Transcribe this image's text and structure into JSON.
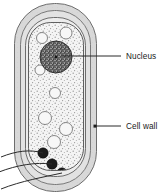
{
  "figure": {
    "kind": "cell-diagram",
    "title": "",
    "background_color": "#ffffff",
    "width": 164,
    "height": 196
  },
  "labels": [
    {
      "id": "nucleus",
      "text": "Nucleus",
      "x": 126,
      "y": 59,
      "leader_from": {
        "x": 62,
        "y": 56
      },
      "leader_to": {
        "x": 122,
        "y": 56
      }
    },
    {
      "id": "cell-wall",
      "text": "Cell wall",
      "x": 126,
      "y": 129,
      "leader_from": {
        "x": 96,
        "y": 126
      },
      "leader_to": {
        "x": 122,
        "y": 126
      }
    }
  ],
  "structures": {
    "cell_wall_outer": {
      "name": "cell-wall-outer",
      "fill": "#d4d4d4",
      "stroke": "#6b6b6b"
    },
    "cell_wall_inner": {
      "name": "cell-wall-inner",
      "fill": "#e0e0e0",
      "stroke": "#6b6b6b"
    },
    "cell_membrane": {
      "name": "cell-membrane",
      "fill": "#ededed",
      "stroke": "#5a5a5a"
    },
    "cytoplasm": {
      "name": "cytoplasm",
      "fill": "#f2f2f2",
      "stroke": "#555555"
    },
    "nucleus": {
      "name": "nucleus",
      "cx": 56,
      "cy": 57,
      "r": 16,
      "fill": "#8a8a8a",
      "stroke": "#3a3a3a"
    },
    "vacuoles": [
      {
        "cx": 42,
        "cy": 38,
        "r": 5.5
      },
      {
        "cx": 66,
        "cy": 33,
        "r": 6.0
      },
      {
        "cx": 40,
        "cy": 70,
        "r": 5.0
      },
      {
        "cx": 55,
        "cy": 93,
        "r": 5.5
      },
      {
        "cx": 45,
        "cy": 118,
        "r": 6.5
      },
      {
        "cx": 66,
        "cy": 129,
        "r": 6.5
      },
      {
        "cx": 54,
        "cy": 142,
        "r": 6.5
      }
    ],
    "granules": [
      {
        "id": "granule-1",
        "cx": 43,
        "cy": 153,
        "r": 5.2,
        "leader": "M 43 153 C 30 150 16 152 2 158"
      },
      {
        "id": "granule-2",
        "cx": 52,
        "cy": 164,
        "r": 5.2,
        "leader": "M 52 164 C 36 163 18 166 0 172"
      },
      {
        "id": "granule-3",
        "cx": 62,
        "cy": 173,
        "r": 5.2,
        "leader": "M 62 173 C 44 176 22 180 2 188"
      }
    ]
  },
  "colors": {
    "outline": "#5a5a5a",
    "wall_fill": "#d4d4d4",
    "membrane_fill": "#e6e6e6",
    "cytoplasm_fill": "#f2f2f2",
    "nucleus_fill": "#8f8f8f",
    "granule_fill": "#1c1c1c",
    "leader_line": "#2b2b2b",
    "text": "#1a1a1a"
  }
}
